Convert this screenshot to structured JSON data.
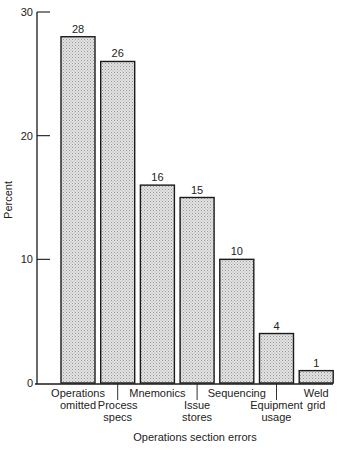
{
  "chart_data": {
    "type": "bar",
    "title": "",
    "xlabel": "Operations section errors",
    "ylabel": "Percent",
    "ylim": [
      0,
      30
    ],
    "yticks": [
      0,
      10,
      20,
      30
    ],
    "grid": false,
    "legend": null,
    "categories": [
      "Operations omitted",
      "Process specs",
      "Mnemonics",
      "Issue stores",
      "Sequencing",
      "Equipment usage",
      "Weld grid"
    ],
    "values": [
      28,
      26,
      16,
      15,
      10,
      4,
      1
    ],
    "category_label_lines": [
      [
        "Operations",
        "omitted"
      ],
      [
        "Process",
        "specs"
      ],
      [
        "Mnemonics"
      ],
      [
        "Issue",
        "stores"
      ],
      [
        "Sequencing"
      ],
      [
        "Equipment",
        "usage"
      ],
      [
        "Weld",
        "grid"
      ]
    ],
    "category_label_staggered": [
      false,
      true,
      false,
      true,
      false,
      true,
      false
    ],
    "data_labels": [
      "28",
      "26",
      "16",
      "15",
      "10",
      "4",
      "1"
    ],
    "bar_fill": "#d9d9d9",
    "bar_stroke": "#1a1a1a"
  }
}
